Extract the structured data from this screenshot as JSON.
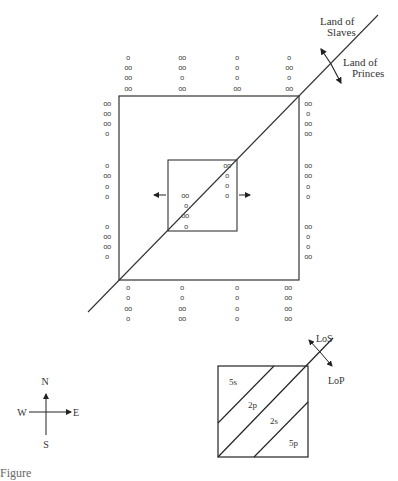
{
  "diagram": {
    "main": {
      "divider_labels": {
        "upper": [
          "Land of",
          "Slaves"
        ],
        "lower": [
          "Land of",
          "Princes"
        ]
      },
      "top_rows": [
        [
          "o",
          "oo",
          "oo",
          "oo"
        ],
        [
          "oo",
          "oo",
          "o",
          "oo"
        ],
        [
          "o",
          "o",
          "o",
          "oo"
        ],
        [
          "o",
          "oo",
          "o",
          "oo"
        ]
      ],
      "left_groups": [
        [
          "oo",
          "oo",
          "oo",
          "o"
        ],
        [
          "o",
          "oo",
          "o",
          "o"
        ],
        [
          "o",
          "oo",
          "oo",
          "o"
        ]
      ],
      "right_groups": [
        [
          "oo",
          "o",
          "oo",
          "oo"
        ],
        [
          "oo",
          "oo",
          "o",
          "o"
        ],
        [
          "oo",
          "o",
          "o",
          "oo"
        ]
      ],
      "bottom_cols": [
        [
          "o",
          "o",
          "oo",
          "o"
        ],
        [
          "o",
          "o",
          "oo",
          "oo"
        ],
        [
          "o",
          "o",
          "o",
          "o"
        ],
        [
          "oo",
          "oo",
          "oo",
          "oo"
        ]
      ],
      "inner_left": [
        "oo",
        "o",
        "oo",
        "o"
      ],
      "inner_right": [
        "oo",
        "o",
        "o",
        "o"
      ]
    },
    "compass": {
      "n": "N",
      "s": "S",
      "w": "W",
      "e": "E"
    },
    "inset": {
      "regions": [
        "5s",
        "2p",
        "2s",
        "5p"
      ],
      "divider_labels": {
        "upper": "LoS",
        "lower": "LoP"
      }
    }
  },
  "caption": "Figure"
}
